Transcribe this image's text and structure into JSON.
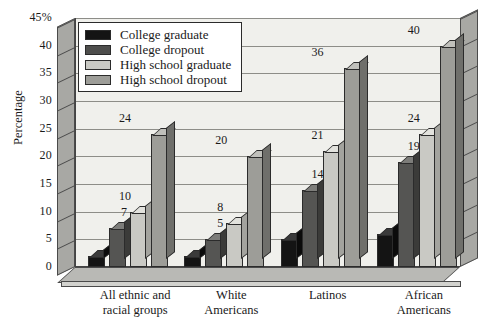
{
  "chart_data": {
    "type": "bar",
    "title": "",
    "xlabel": "",
    "ylabel": "Percentage",
    "ylim": [
      0,
      45
    ],
    "ytick_labels": [
      "0",
      "5",
      "10",
      "15",
      "20",
      "25",
      "30",
      "35",
      "40",
      "45%"
    ],
    "ytick_values": [
      0,
      5,
      10,
      15,
      20,
      25,
      30,
      35,
      40,
      45
    ],
    "grid": true,
    "legend_position": "top-left",
    "categories": [
      "All ethnic and racial groups",
      "White Americans",
      "Latinos",
      "African Americans"
    ],
    "category_lines": [
      [
        "All ethnic and",
        "racial groups"
      ],
      [
        "White",
        "Americans"
      ],
      [
        "Latinos",
        ""
      ],
      [
        "African",
        "Americans"
      ]
    ],
    "series": [
      {
        "name": "College graduate",
        "color": "#141414",
        "values": [
          2,
          2,
          5,
          6
        ]
      },
      {
        "name": "College dropout",
        "color": "#4e4e4c",
        "values": [
          7,
          5,
          14,
          19
        ]
      },
      {
        "name": "High school graduate",
        "color": "#c9c9c4",
        "values": [
          10,
          8,
          21,
          24
        ]
      },
      {
        "name": "High school dropout",
        "color": "#9d9d98",
        "values": [
          24,
          20,
          36,
          40
        ]
      }
    ]
  },
  "legend": {
    "items": [
      {
        "label": "College graduate"
      },
      {
        "label": "College dropout"
      },
      {
        "label": "High school graduate"
      },
      {
        "label": "High school dropout"
      }
    ]
  },
  "axis": {
    "y_title": "Percentage"
  }
}
